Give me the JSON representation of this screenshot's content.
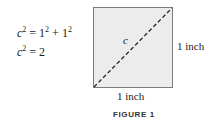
{
  "equations": [
    {
      "lhs_var": "c",
      "lhs_exp": "2",
      "op": " = ",
      "t1": "1",
      "t1_exp": "2",
      "plus": " + ",
      "t2": "1",
      "t2_exp": "2"
    },
    {
      "lhs_var": "c",
      "lhs_exp": "2",
      "op": " = ",
      "rhs": "2"
    }
  ],
  "figure": {
    "diagonal_label": "c",
    "side_label_right": "1 inch",
    "side_label_bottom": "1 inch",
    "caption": "FIGURE 1",
    "colors": {
      "fill": "#ececec",
      "border": "#7a7a7a",
      "diagonal": "#222222"
    }
  }
}
